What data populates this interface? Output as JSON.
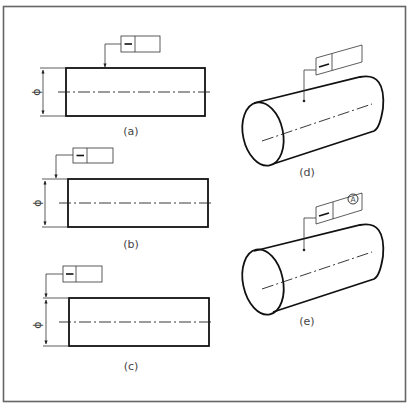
{
  "figure": {
    "frame_color": "#666666",
    "line_color": "#111111"
  },
  "panels": [
    {
      "id": "a",
      "label": "(a)",
      "dimension_symbol": "ϕ",
      "tolerance_symbol": "—",
      "tolerance_value": "",
      "modifier": ""
    },
    {
      "id": "b",
      "label": "(b)",
      "dimension_symbol": "ϕ",
      "tolerance_symbol": "—",
      "tolerance_value": "",
      "modifier": ""
    },
    {
      "id": "c",
      "label": "(c)",
      "dimension_symbol": "ϕ",
      "tolerance_symbol": "—",
      "tolerance_value": "",
      "modifier": ""
    },
    {
      "id": "d",
      "label": "(d)",
      "tolerance_symbol": "—",
      "tolerance_value": "",
      "modifier": ""
    },
    {
      "id": "e",
      "label": "(e)",
      "tolerance_symbol": "—",
      "tolerance_value": "",
      "modifier": "A"
    }
  ]
}
